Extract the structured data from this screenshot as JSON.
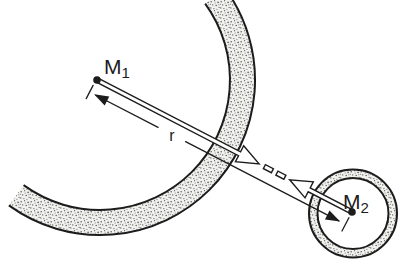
{
  "diagram": {
    "type": "physics-figure",
    "labels": {
      "mass1": {
        "base": "M",
        "sub": "1"
      },
      "mass2": {
        "base": "M",
        "sub": "2"
      },
      "distance": "r"
    },
    "colors": {
      "ink": "#1c1c1c",
      "background": "#ffffff",
      "arrow_fill": "#ffffff",
      "stipple_base": "#f1f1ee",
      "stipple_dot": "#59595b"
    }
  }
}
